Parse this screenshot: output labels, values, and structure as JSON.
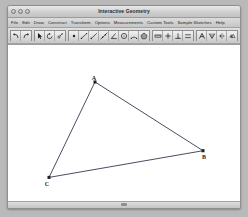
{
  "window": {
    "title": "Interactive Geometry",
    "traffic_lights": [
      {
        "name": "close",
        "label": "Close"
      },
      {
        "name": "minimize",
        "label": "Minimize"
      },
      {
        "name": "zoom",
        "label": "Zoom"
      }
    ]
  },
  "menu": {
    "items": [
      {
        "label": "File"
      },
      {
        "label": "Edit"
      },
      {
        "label": "Draw"
      },
      {
        "label": "Construct"
      },
      {
        "label": "Transform"
      },
      {
        "label": "Options"
      },
      {
        "label": "Measurements"
      },
      {
        "label": "Custom Tools"
      },
      {
        "label": "Sample Sketches"
      },
      {
        "label": "Help"
      }
    ]
  },
  "toolbar": {
    "groups": [
      {
        "name": "history",
        "buttons": [
          {
            "icon": "undo-icon",
            "label": "Undo",
            "active": false
          },
          {
            "icon": "redo-icon",
            "label": "Redo",
            "active": false
          }
        ]
      },
      {
        "name": "selection",
        "buttons": [
          {
            "icon": "arrow-select-icon",
            "label": "Select Arrow",
            "active": false
          },
          {
            "icon": "rotate-icon",
            "label": "Rotate",
            "active": false
          },
          {
            "icon": "dilate-icon",
            "label": "Dilate",
            "active": false
          }
        ]
      },
      {
        "name": "drawing",
        "buttons": [
          {
            "icon": "point-icon",
            "label": "Point",
            "active": false
          },
          {
            "icon": "segment-icon",
            "label": "Segment",
            "active": false
          },
          {
            "icon": "ray-icon",
            "label": "Ray",
            "active": false
          },
          {
            "icon": "line-icon",
            "label": "Line",
            "active": false
          },
          {
            "icon": "angle-icon",
            "label": "Angle",
            "active": false
          },
          {
            "icon": "circle-icon",
            "label": "Circle",
            "active": false
          },
          {
            "icon": "arc-icon",
            "label": "Arc",
            "active": false
          },
          {
            "icon": "polygon-icon",
            "label": "Polygon",
            "active": false
          }
        ]
      },
      {
        "name": "measurement",
        "buttons": [
          {
            "icon": "ruler-icon",
            "label": "Measure Length",
            "active": false
          },
          {
            "icon": "plus-icon",
            "label": "Calculate",
            "active": false
          },
          {
            "icon": "perpendicular-icon",
            "label": "Perpendicular",
            "active": false
          },
          {
            "icon": "parallel-icon",
            "label": "Parallel",
            "active": false
          }
        ]
      },
      {
        "name": "annotation",
        "buttons": [
          {
            "icon": "text-label-icon",
            "label": "Text Label",
            "active": false
          },
          {
            "icon": "marker-icon",
            "label": "Marker",
            "active": false
          },
          {
            "icon": "reflect-icon",
            "label": "Reflect",
            "active": false
          },
          {
            "icon": "translate-icon",
            "label": "Translate",
            "active": false
          }
        ]
      },
      {
        "name": "view",
        "buttons": [
          {
            "icon": "zoom-icon",
            "label": "Zoom",
            "active": false
          },
          {
            "icon": "grid-icon",
            "label": "Show Grid",
            "active": false
          }
        ]
      }
    ]
  },
  "sketch": {
    "type": "triangle",
    "stroke_color": "#3a3a52",
    "point_color": "#222222",
    "points": [
      {
        "label": "A",
        "x": 87,
        "y": 36,
        "label_dx": -1,
        "label_dy": -2
      },
      {
        "label": "B",
        "x": 195,
        "y": 103,
        "label_dx": 1,
        "label_dy": 8
      },
      {
        "label": "C",
        "x": 41,
        "y": 129,
        "label_dx": -2,
        "label_dy": 8
      }
    ],
    "segments": [
      {
        "from": "A",
        "to": "B"
      },
      {
        "from": "B",
        "to": "C"
      },
      {
        "from": "C",
        "to": "A"
      }
    ]
  },
  "bottom": {
    "scrollbar_name": "horizontal-scrollbar"
  }
}
